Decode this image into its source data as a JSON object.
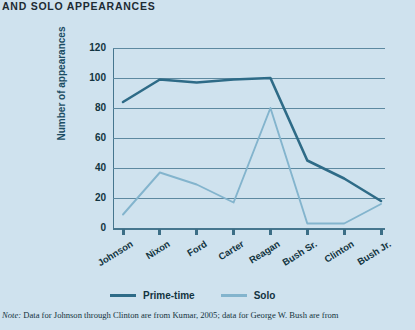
{
  "heading": "AND SOLO APPEARANCES",
  "footnote": {
    "label": "Note:",
    "text": " Data for Johnson through Clinton are from Kumar, 2005; data for George W. Bush are from"
  },
  "legend": {
    "items": [
      {
        "label": "Prime-time",
        "color": "#2e6b87"
      },
      {
        "label": "Solo",
        "color": "#83b4cd"
      }
    ]
  },
  "colors": {
    "background": "#cfe2ee",
    "prime_time": "#2e6b87",
    "solo": "#83b4cd",
    "grid": "#5d89a0",
    "axis": "#46768e",
    "text": "#123440"
  },
  "chart_data": {
    "type": "line",
    "title": "AND SOLO APPEARANCES",
    "xlabel": "",
    "ylabel": "Number of appearances",
    "ylim": [
      0,
      120
    ],
    "yticks": [
      0,
      20,
      40,
      60,
      80,
      100,
      120
    ],
    "grid": true,
    "legend_position": "bottom",
    "categories": [
      "Johnson",
      "Nixon",
      "Ford",
      "Carter",
      "Reagan",
      "Bush Sr.",
      "Clinton",
      "Bush Jr."
    ],
    "series": [
      {
        "name": "Prime-time",
        "color": "#2e6b87",
        "values": [
          84,
          99,
          97,
          99,
          100,
          45,
          33,
          18
        ]
      },
      {
        "name": "Solo",
        "color": "#83b4cd",
        "values": [
          9,
          37,
          29,
          17,
          80,
          3,
          3,
          16
        ]
      }
    ]
  }
}
